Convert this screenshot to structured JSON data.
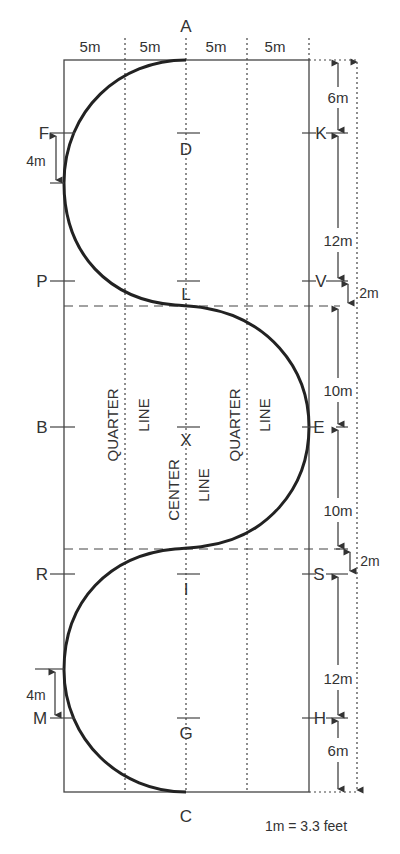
{
  "diagram": {
    "type": "dressage-arena-serpentine",
    "letters": {
      "top": "A",
      "bottom": "C",
      "center_line": [
        "D",
        "L",
        "X",
        "I",
        "G"
      ],
      "left_side": [
        "F",
        "P",
        "B",
        "R",
        "M"
      ],
      "right_side": [
        "K",
        "V",
        "E",
        "S",
        "H"
      ]
    },
    "width_segments": [
      "5m",
      "5m",
      "5m",
      "5m"
    ],
    "left_dims": [
      "4m",
      "4m"
    ],
    "right_dims": [
      "6m",
      "12m",
      "2m",
      "10m",
      "10m",
      "2m",
      "12m",
      "6m"
    ],
    "line_labels": {
      "quarter_left": [
        "QUARTER",
        "LINE"
      ],
      "center": [
        "CENTER",
        "LINE"
      ],
      "quarter_right": [
        "QUARTER",
        "LINE"
      ]
    },
    "scale_note": "1m = 3.3 feet"
  }
}
